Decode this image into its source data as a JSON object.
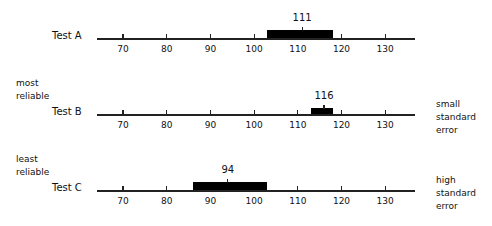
{
  "chart_data": {
    "type": "bar",
    "title": "",
    "xlabel": "",
    "ylabel": "",
    "xlim": [
      64,
      137
    ],
    "ticks": [
      70,
      80,
      90,
      100,
      110,
      120,
      130
    ],
    "tick_labels": [
      "70",
      "80",
      "90",
      "100",
      "110",
      "120",
      "130"
    ],
    "grid": false,
    "series": [
      {
        "name": "Test A",
        "score": 111,
        "low": 103,
        "high": 118,
        "score_label": "111"
      },
      {
        "name": "Test B",
        "score": 116,
        "low": 113,
        "high": 118,
        "score_label": "116"
      },
      {
        "name": "Test C",
        "score": 94,
        "low": 86,
        "high": 103,
        "score_label": "94"
      }
    ],
    "annotations": {
      "left": [
        {
          "row": "Test B",
          "text": [
            "most",
            "reliable"
          ]
        },
        {
          "row": "Test C",
          "text": [
            "least",
            "reliable"
          ]
        }
      ],
      "right": [
        {
          "row": "Test B",
          "text": [
            "small",
            "standard",
            "error"
          ]
        },
        {
          "row": "Test C",
          "text": [
            "high",
            "standard",
            "error"
          ]
        }
      ]
    }
  },
  "rows": [
    {
      "label": "Test A",
      "score_label": "111"
    },
    {
      "label": "Test B",
      "score_label": "116"
    },
    {
      "label": "Test C",
      "score_label": "94"
    }
  ],
  "notes": {
    "most_1": "most",
    "most_2": "reliable",
    "least_1": "least",
    "least_2": "reliable",
    "small_1": "small",
    "small_2": "standard",
    "small_3": "error",
    "high_1": "high",
    "high_2": "standard",
    "high_3": "error"
  },
  "ticks": [
    "70",
    "80",
    "90",
    "100",
    "110",
    "120",
    "130"
  ]
}
